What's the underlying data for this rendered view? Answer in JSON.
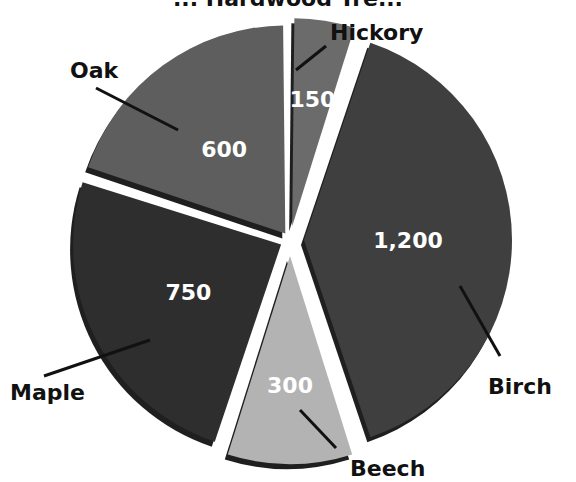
{
  "chart_data": {
    "type": "pie",
    "title": "... Hardwood Tre...",
    "title_visible_fragment": "Hardwood Tre",
    "categories": [
      "Hickory",
      "Birch",
      "Beech",
      "Maple",
      "Oak"
    ],
    "values": [
      150,
      1200,
      300,
      750,
      600
    ],
    "value_labels": [
      "150",
      "1,200",
      "300",
      "750",
      "600"
    ],
    "colors": [
      "#6b6b6b",
      "#3f3f3f",
      "#b3b3b3",
      "#2e2e2e",
      "#5e5e5e"
    ],
    "start_angle_deg": 0,
    "direction": "clockwise",
    "legend": "none (callout labels)"
  },
  "labels": {
    "hickory": "Hickory",
    "birch": "Birch",
    "beech": "Beech",
    "maple": "Maple",
    "oak": "Oak"
  }
}
